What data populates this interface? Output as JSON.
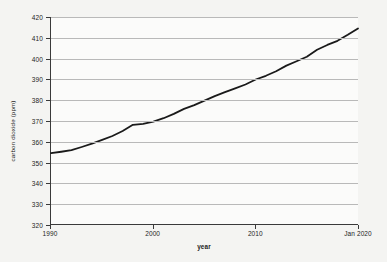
{
  "chart_data": {
    "type": "line",
    "title": "",
    "xlabel": "year",
    "ylabel": "carbon dioxide (ppm)",
    "grid": true,
    "legend": null,
    "xlim": [
      1990,
      2020
    ],
    "ylim": [
      320,
      420
    ],
    "yticks": [
      320,
      330,
      340,
      350,
      360,
      370,
      380,
      390,
      400,
      410,
      420
    ],
    "ytick_labels": [
      "320",
      "330",
      "340",
      "350",
      "360",
      "370",
      "380",
      "390",
      "400",
      "410",
      "420"
    ],
    "xticks": [
      1990,
      2000,
      2010,
      2020
    ],
    "xtick_labels": [
      "1990",
      "2000",
      "2010",
      "Jan 2020"
    ],
    "line_color": "#1a1a1a",
    "line_width": 1.8,
    "series": [
      {
        "name": "carbon dioxide",
        "x": [
          1990,
          1991,
          1992,
          1993,
          1994,
          1995,
          1996,
          1997,
          1998,
          1999,
          2000,
          2001,
          2002,
          2003,
          2004,
          2005,
          2006,
          2007,
          2008,
          2009,
          2010,
          2011,
          2012,
          2013,
          2014,
          2015,
          2016,
          2017,
          2018,
          2019,
          2020
        ],
        "values": [
          354.2,
          354.9,
          355.7,
          357.2,
          358.8,
          360.6,
          362.5,
          364.9,
          367.9,
          368.4,
          369.5,
          371.1,
          373.2,
          375.6,
          377.4,
          379.6,
          381.8,
          383.7,
          385.5,
          387.4,
          389.8,
          391.6,
          393.8,
          396.5,
          398.6,
          400.8,
          404.2,
          406.5,
          408.5,
          411.4,
          414.5
        ]
      }
    ]
  }
}
